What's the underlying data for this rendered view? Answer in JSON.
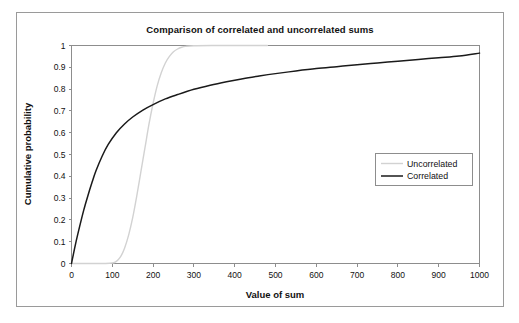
{
  "chart_data": {
    "type": "line",
    "title": "Comparison of correlated and uncorrelated sums",
    "xlabel": "Value of sum",
    "ylabel": "Cumulative probability",
    "xlim": [
      0,
      1000
    ],
    "ylim": [
      0,
      1
    ],
    "grid": false,
    "legend_position": "center-right",
    "xticks": [
      "0",
      "100",
      "200",
      "300",
      "400",
      "500",
      "600",
      "700",
      "800",
      "900",
      "1000"
    ],
    "xtick_values": [
      0,
      100,
      200,
      300,
      400,
      500,
      600,
      700,
      800,
      900,
      1000
    ],
    "yticks": [
      "0",
      "0.1",
      "0.2",
      "0.3",
      "0.4",
      "0.5",
      "0.6",
      "0.7",
      "0.8",
      "0.9",
      "1"
    ],
    "ytick_values": [
      0,
      0.1,
      0.2,
      0.3,
      0.4,
      0.5,
      0.6,
      0.7,
      0.8,
      0.9,
      1
    ],
    "series": [
      {
        "name": "Uncorrelated",
        "color": "#d2d2d2",
        "x": [
          0,
          20,
          40,
          60,
          80,
          100,
          110,
          120,
          130,
          140,
          150,
          160,
          170,
          180,
          190,
          200,
          210,
          220,
          230,
          240,
          250,
          260,
          270,
          280,
          300,
          350,
          400,
          450,
          480
        ],
        "values": [
          0,
          0,
          0,
          0,
          0,
          0.002,
          0.01,
          0.03,
          0.07,
          0.13,
          0.21,
          0.31,
          0.42,
          0.53,
          0.64,
          0.735,
          0.815,
          0.875,
          0.92,
          0.95,
          0.971,
          0.984,
          0.992,
          0.996,
          0.999,
          1,
          1,
          1,
          1
        ]
      },
      {
        "name": "Correlated",
        "color": "#1a1a1a",
        "x": [
          0,
          10,
          20,
          30,
          40,
          50,
          60,
          75,
          90,
          110,
          130,
          150,
          175,
          200,
          230,
          260,
          300,
          340,
          380,
          420,
          460,
          500,
          550,
          600,
          650,
          700,
          750,
          800,
          850,
          900,
          950,
          1000
        ],
        "values": [
          0,
          0.09,
          0.17,
          0.245,
          0.31,
          0.37,
          0.425,
          0.492,
          0.546,
          0.6,
          0.64,
          0.672,
          0.704,
          0.729,
          0.755,
          0.775,
          0.799,
          0.818,
          0.834,
          0.848,
          0.86,
          0.871,
          0.883,
          0.894,
          0.903,
          0.912,
          0.92,
          0.928,
          0.936,
          0.944,
          0.952,
          0.965
        ]
      }
    ]
  },
  "legend": {
    "entries": [
      {
        "label": "Uncorrelated"
      },
      {
        "label": "Correlated"
      }
    ]
  }
}
